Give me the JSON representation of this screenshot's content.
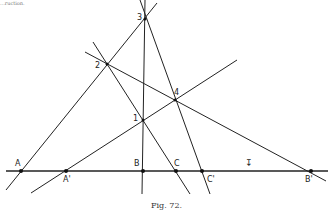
{
  "caption": "Fig. 72.",
  "top_fragment": "...ruction.",
  "points": {
    "A": {
      "label": "A",
      "x": 21,
      "y": 171
    },
    "A_prime": {
      "label": "A'",
      "x": 66,
      "y": 171
    },
    "B": {
      "label": "B",
      "x": 143,
      "y": 171
    },
    "C": {
      "label": "C",
      "x": 176,
      "y": 171
    },
    "C_prime": {
      "label": "C'",
      "x": 202,
      "y": 171
    },
    "B_prime": {
      "label": "B'",
      "x": 311,
      "y": 171
    },
    "p1": {
      "label": "1",
      "x": 143,
      "y": 120
    },
    "p2": {
      "label": "2",
      "x": 107,
      "y": 64
    },
    "p3": {
      "label": "3",
      "x": 145,
      "y": 19
    },
    "p4": {
      "label": "4",
      "x": 175,
      "y": 100
    }
  },
  "mark": "↧"
}
